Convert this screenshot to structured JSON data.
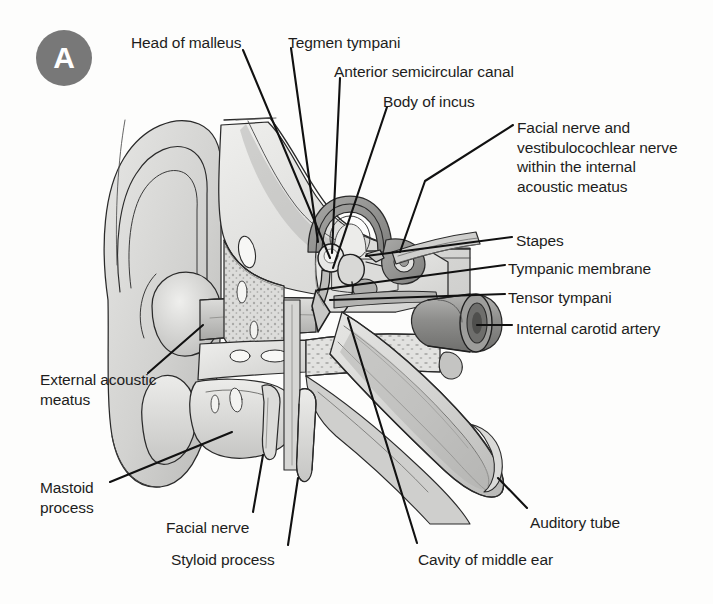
{
  "figure": {
    "panel_badge": "A",
    "badge_color": "#787878",
    "background_color": "#fdfdfc",
    "line_color": "#111111",
    "text_color": "#1d1d1d"
  },
  "labels": [
    {
      "id": "head-of-malleus",
      "text": "Head of malleus",
      "x": 131,
      "y": 33,
      "align": "left"
    },
    {
      "id": "tegmen-tympani",
      "text": "Tegmen tympani",
      "x": 288,
      "y": 33,
      "align": "left"
    },
    {
      "id": "anterior-semicircular-canal",
      "text": "Anterior semicircular canal",
      "x": 334,
      "y": 62,
      "align": "left"
    },
    {
      "id": "body-of-incus",
      "text": "Body of incus",
      "x": 383,
      "y": 92,
      "align": "left"
    },
    {
      "id": "facial-vestibulocochlear-nerve",
      "text": "Facial nerve and\nvestibulocochlear nerve\nwithin the internal\nacoustic meatus",
      "x": 517,
      "y": 118,
      "align": "left"
    },
    {
      "id": "stapes",
      "text": "Stapes",
      "x": 516,
      "y": 231,
      "align": "left"
    },
    {
      "id": "tympanic-membrane",
      "text": "Tympanic membrane",
      "x": 508,
      "y": 259,
      "align": "left"
    },
    {
      "id": "tensor-tympani",
      "text": "Tensor tympani",
      "x": 508,
      "y": 288,
      "align": "left"
    },
    {
      "id": "internal-carotid-artery",
      "text": "Internal carotid artery",
      "x": 516,
      "y": 319,
      "align": "left"
    },
    {
      "id": "external-acoustic-meatus",
      "text": "External acoustic\nmeatus",
      "x": 40,
      "y": 370,
      "align": "left"
    },
    {
      "id": "mastoid-process",
      "text": "Mastoid\nprocess",
      "x": 40,
      "y": 478,
      "align": "left"
    },
    {
      "id": "facial-nerve",
      "text": "Facial nerve",
      "x": 166,
      "y": 518,
      "align": "left"
    },
    {
      "id": "styloid-process",
      "text": "Styloid process",
      "x": 171,
      "y": 550,
      "align": "left"
    },
    {
      "id": "cavity-of-middle-ear",
      "text": "Cavity of middle ear",
      "x": 418,
      "y": 550,
      "align": "left"
    },
    {
      "id": "auditory-tube",
      "text": "Auditory tube",
      "x": 530,
      "y": 513,
      "align": "left"
    }
  ],
  "leader_lines": [
    {
      "id": "leader-head-of-malleus",
      "points": "243,50 330,258"
    },
    {
      "id": "leader-tegmen-tympani",
      "points": "291,48 318,242"
    },
    {
      "id": "leader-anterior-semicircular-canal",
      "points": "340,78 332,253"
    },
    {
      "id": "leader-body-of-incus",
      "points": "387,107 333,268"
    },
    {
      "id": "leader-facial-vestibulocochlear",
      "points": "513,125 425,181 400,252"
    },
    {
      "id": "leader-stapes",
      "points": "512,237 366,256"
    },
    {
      "id": "leader-tympanic-membrane",
      "points": "505,265 318,290"
    },
    {
      "id": "leader-tensor-tympani",
      "points": "505,294 330,300"
    },
    {
      "id": "leader-internal-carotid",
      "points": "512,325 477,325"
    },
    {
      "id": "leader-external-acoustic-meatus",
      "points": "148,373 203,325"
    },
    {
      "id": "leader-mastoid-process",
      "points": "110,482 232,432"
    },
    {
      "id": "leader-facial-nerve",
      "points": "253,512 263,455"
    },
    {
      "id": "leader-styloid-process",
      "points": "288,545 298,478"
    },
    {
      "id": "leader-cavity-of-middle-ear",
      "points": "417,543 348,318"
    },
    {
      "id": "leader-auditory-tube",
      "points": "527,508 498,478"
    }
  ]
}
